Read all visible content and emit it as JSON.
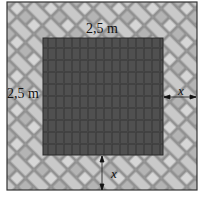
{
  "diagram": {
    "type": "geometry-figure",
    "labels": {
      "top_side": "2,5 m",
      "left_side": "2,5 m",
      "right_width": "x",
      "bottom_width": "x"
    },
    "colors": {
      "inner_square": "#4a4a4a",
      "border_paving_light": "#c8c8c8",
      "border_paving_dark": "#8a8a8a",
      "frame": "#333333"
    }
  }
}
